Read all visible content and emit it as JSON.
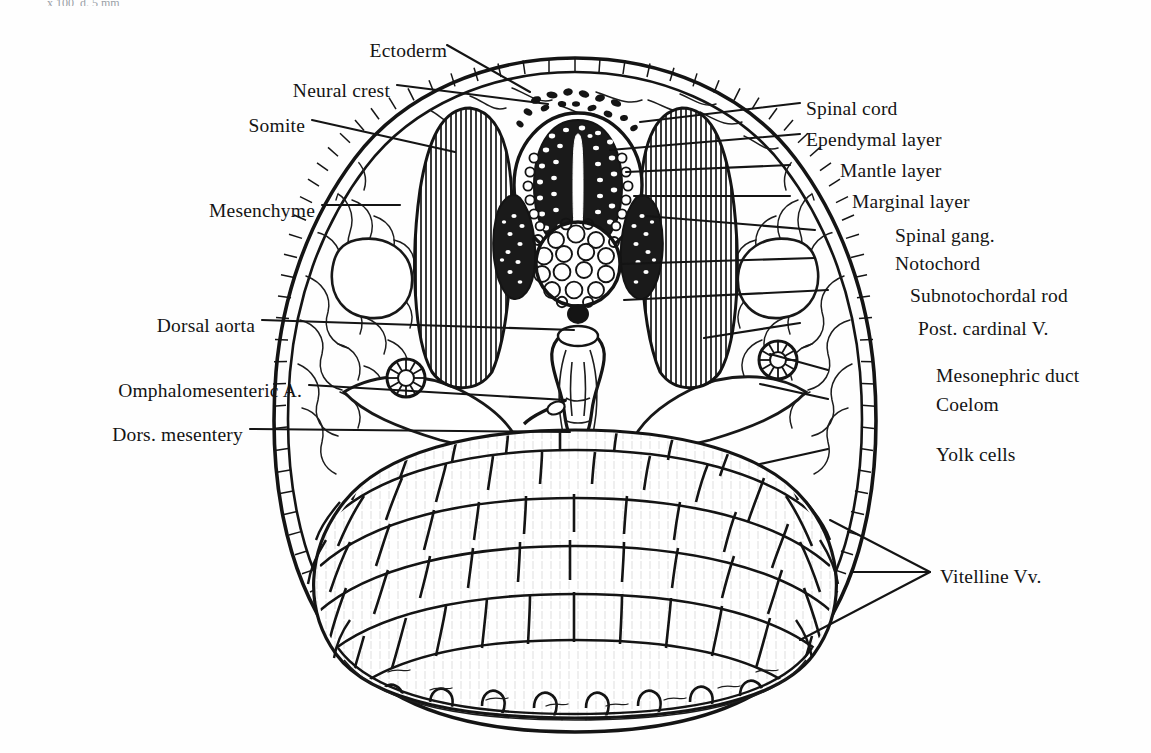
{
  "figure": {
    "title_fragment": "x 100, d. 5 mm",
    "background_color": "#fefefe",
    "ink_color": "#141414"
  },
  "labels_left": [
    {
      "id": "ectoderm",
      "text": "Ectoderm",
      "x": 347,
      "y": 52,
      "lx": 447,
      "ly": 45,
      "tx": 530,
      "ty": 92
    },
    {
      "id": "neural-crest",
      "text": "Neural crest",
      "x": 257,
      "y": 92,
      "lx": 397,
      "ly": 85,
      "tx": 548,
      "ty": 104
    },
    {
      "id": "somite",
      "text": "Somite",
      "x": 228,
      "y": 127,
      "lx": 312,
      "ly": 120,
      "tx": 455,
      "ty": 152
    },
    {
      "id": "mesenchyme",
      "text": "Mesenchyme",
      "x": 185,
      "y": 212,
      "lx": 322,
      "ly": 205,
      "tx": 400,
      "ty": 205
    },
    {
      "id": "dorsal-aorta",
      "text": "Dorsal aorta",
      "x": 128,
      "y": 327,
      "lx": 262,
      "ly": 320,
      "tx": 574,
      "ty": 330
    },
    {
      "id": "omphalomesenteric-a",
      "text": "Omphalomesenteric A.",
      "x": 41,
      "y": 392,
      "lx": 309,
      "ly": 385,
      "tx": 566,
      "ty": 400
    },
    {
      "id": "dors-mesentery",
      "text": "Dors. mesentery",
      "x": 65,
      "y": 436,
      "lx": 250,
      "ly": 429,
      "tx": 570,
      "ty": 432
    }
  ],
  "labels_right": [
    {
      "id": "spinal-cord",
      "text": "Spinal cord",
      "x": 806,
      "y": 110,
      "lx": 800,
      "ly": 103,
      "tx": 640,
      "ty": 122
    },
    {
      "id": "ependymal-layer",
      "text": "Ependymal layer",
      "x": 806,
      "y": 141,
      "lx": 800,
      "ly": 134,
      "tx": 610,
      "ty": 150
    },
    {
      "id": "mantle-layer",
      "text": "Mantle layer",
      "x": 840,
      "y": 172,
      "lx": 790,
      "ly": 165,
      "tx": 626,
      "ty": 172
    },
    {
      "id": "marginal-layer",
      "text": "Marginal layer",
      "x": 852,
      "y": 203,
      "lx": 790,
      "ly": 196,
      "tx": 634,
      "ty": 196
    },
    {
      "id": "spinal-gang",
      "text": "Spinal gang.",
      "x": 895,
      "y": 237,
      "lx": 815,
      "ly": 230,
      "tx": 646,
      "ty": 216
    },
    {
      "id": "notochord",
      "text": "Notochord",
      "x": 895,
      "y": 265,
      "lx": 815,
      "ly": 258,
      "tx": 620,
      "ty": 264
    },
    {
      "id": "subnotochordal-rod",
      "text": "Subnotochordal rod",
      "x": 910,
      "y": 297,
      "lx": 828,
      "ly": 290,
      "tx": 624,
      "ty": 300
    },
    {
      "id": "post-cardinal-v",
      "text": "Post. cardinal V.",
      "x": 918,
      "y": 330,
      "lx": 800,
      "ly": 323,
      "tx": 704,
      "ty": 338
    },
    {
      "id": "mesonephric-duct",
      "text": "Mesonephric duct",
      "x": 936,
      "y": 377,
      "lx": 828,
      "ly": 370,
      "tx": 770,
      "ty": 354
    },
    {
      "id": "coelom",
      "text": "Coelom",
      "x": 936,
      "y": 406,
      "lx": 828,
      "ly": 399,
      "tx": 760,
      "ty": 384
    },
    {
      "id": "yolk-cells",
      "text": "Yolk cells",
      "x": 936,
      "y": 456,
      "lx": 828,
      "ly": 449,
      "tx": 760,
      "ty": 464
    }
  ],
  "labels_bracket": [
    {
      "id": "vitelline-vv",
      "text": "Vitelline Vv.",
      "x": 940,
      "y": 578,
      "apex_x": 930,
      "apex_y": 572,
      "targets": [
        {
          "tx": 830,
          "ty": 520
        },
        {
          "tx": 852,
          "ty": 572
        },
        {
          "tx": 800,
          "ty": 640
        }
      ]
    }
  ],
  "structures": [
    {
      "id": "ectoderm-epithelium",
      "name": "Ectoderm",
      "description": "Outer ladder-like epithelial layer enclosing the whole section"
    },
    {
      "id": "neural-crest-cells",
      "name": "Neural crest",
      "description": "Scattered dark cells dorsal to the neural tube"
    },
    {
      "id": "somite-block",
      "name": "Somite",
      "description": "Vertically hatched paired blocks flanking the neural tube"
    },
    {
      "id": "mesenchyme-mesh",
      "name": "Mesenchyme",
      "description": "Loose reticular tissue filling the lateral body wall"
    },
    {
      "id": "spinal-cord-tube",
      "name": "Spinal cord",
      "description": "Oval neural tube with central canal"
    },
    {
      "id": "ependymal-layer-zone",
      "name": "Ependymal layer",
      "description": "Cells lining the narrow central canal slit"
    },
    {
      "id": "mantle-layer-zone",
      "name": "Mantle layer",
      "description": "Dense dark cell mass around the ependymal layer"
    },
    {
      "id": "marginal-layer-zone",
      "name": "Marginal layer",
      "description": "Outer pale zone of the neural tube"
    },
    {
      "id": "spinal-ganglion",
      "name": "Spinal gang.",
      "description": "Paired dark lens-shaped ganglia lateral to the cord"
    },
    {
      "id": "notochord-circle",
      "name": "Notochord",
      "description": "Round vacuolated cell mass beneath the neural tube"
    },
    {
      "id": "subnotochordal-rod",
      "name": "Subnotochordal rod",
      "description": "Small solid black dot beneath the notochord"
    },
    {
      "id": "dorsal-aorta-vessel",
      "name": "Dorsal aorta",
      "description": "Median vessel below the subnotochordal rod"
    },
    {
      "id": "post-cardinal-vein",
      "name": "Post. cardinal V.",
      "description": "Lateral paired vein lumen in the body wall"
    },
    {
      "id": "mesonephric-duct-ring",
      "name": "Mesonephric duct",
      "description": "Small radially segmented ring, paired, lateral"
    },
    {
      "id": "coelom-cavity",
      "name": "Coelom",
      "description": "Body cavity between somatic and splanchnic layers"
    },
    {
      "id": "omphalomesenteric-artery",
      "name": "Omphalomesenteric A.",
      "description": "Ventral branch artery running into the mesentery"
    },
    {
      "id": "dorsal-mesentery",
      "name": "Dors. mesentery",
      "description": "Median suspensory membrane of the gut"
    },
    {
      "id": "yolk-cell-mass",
      "name": "Yolk cells",
      "description": "Large polygonal yolk-laden cells filling the ventral mass"
    },
    {
      "id": "vitelline-veins",
      "name": "Vitelline Vv.",
      "description": "Veins in the yolk sac wall, three indicated"
    }
  ]
}
